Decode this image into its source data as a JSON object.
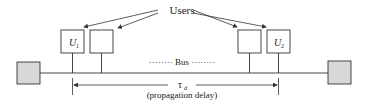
{
  "diagram": {
    "users_label": "Users",
    "bus_label": "········ Bus ········",
    "user1_label": "U",
    "user1_sub": "1",
    "user2_label": "U",
    "user2_sub": "2",
    "tau_label": "τ",
    "tau_sub": "d",
    "delay_label": "(propagation delay)",
    "colors": {
      "line": "#333333",
      "terminator_fill": "#d8d8d8"
    }
  }
}
